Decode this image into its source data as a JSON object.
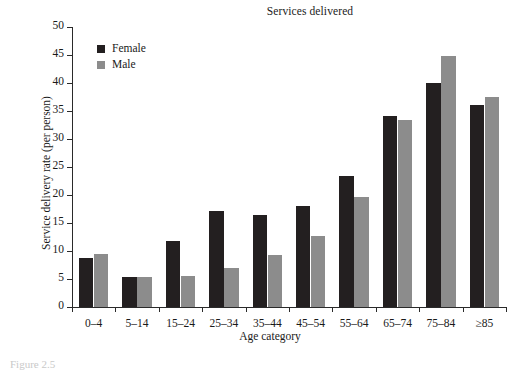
{
  "figure": {
    "caption_fragment": "Figure 2.5"
  },
  "chart_data": {
    "type": "bar",
    "title": "Services delivered",
    "xlabel": "Age category",
    "ylabel": "Service delivery rate (per person)",
    "categories": [
      "0–4",
      "5–14",
      "15–24",
      "25–34",
      "35–44",
      "45–54",
      "55–64",
      "65–74",
      "75–84",
      "≥85"
    ],
    "series": [
      {
        "name": "Female",
        "color": "#231f20",
        "values": [
          8.7,
          5.4,
          11.7,
          17.1,
          16.4,
          18.0,
          23.4,
          34.1,
          40.0,
          36.1
        ]
      },
      {
        "name": "Male",
        "color": "#8c8c8c",
        "values": [
          9.4,
          5.4,
          5.5,
          7.0,
          9.3,
          12.7,
          19.7,
          33.4,
          44.9,
          37.5
        ]
      }
    ],
    "ylim": [
      0,
      50
    ],
    "yticks": [
      0,
      5,
      10,
      15,
      20,
      25,
      30,
      35,
      40,
      45,
      50
    ],
    "ytick_labels": [
      "0",
      "5",
      "10",
      "15",
      "20",
      "25",
      "30",
      "35",
      "40",
      "45",
      "50"
    ],
    "grid": false,
    "legend_position": "upper left"
  }
}
